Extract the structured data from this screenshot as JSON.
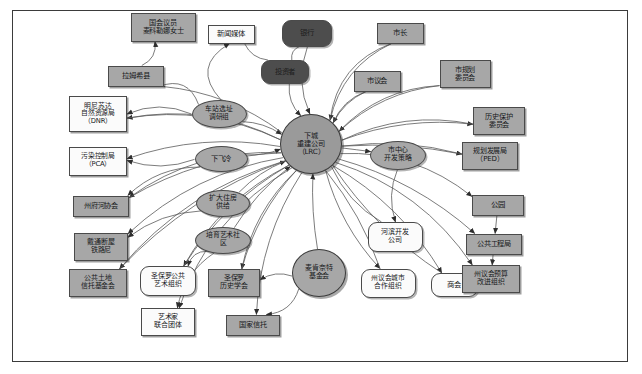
{
  "diagram": {
    "frame": {
      "border_color": "#3b3b3b",
      "background": "#ffffff"
    },
    "palette": {
      "gray_fill": "#a7a7a7",
      "white_fill": "#fbfbfb",
      "dark_fill": "#4d4d4d",
      "core_fill": "#9a9a9a",
      "edge_color": "#5a5a5a",
      "border_color": "#4a4a4a"
    },
    "legend": {
      "rect_meaning": "机构·政府部门",
      "ellipse_meaning": "项目·议题",
      "round_meaning": "企业·社会组织",
      "dark_meaning": "资本方"
    },
    "nodes": [
      {
        "id": "congress",
        "label": "国会议员\n麦科勒娜女士",
        "shape": "rect",
        "fill": "gray",
        "x": 163,
        "y": 27,
        "w": 65,
        "h": 29,
        "fs": 7.2
      },
      {
        "id": "media",
        "label": "新闻媒体",
        "shape": "rect",
        "fill": "white",
        "x": 231,
        "y": 34,
        "w": 47,
        "h": 19,
        "fs": 7.4
      },
      {
        "id": "banks",
        "label": "银行",
        "shape": "round",
        "fill": "dark",
        "x": 307,
        "y": 33,
        "w": 50,
        "h": 27,
        "fs": 7.4
      },
      {
        "id": "mayor",
        "label": "市长",
        "shape": "rect",
        "fill": "gray",
        "x": 400,
        "y": 33,
        "w": 47,
        "h": 21,
        "fs": 7.4
      },
      {
        "id": "ramsey",
        "label": "拉姆希县",
        "shape": "rect",
        "fill": "gray",
        "x": 136,
        "y": 76,
        "w": 56,
        "h": 21,
        "fs": 7.4
      },
      {
        "id": "investors",
        "label": "投资者",
        "shape": "round",
        "fill": "dark",
        "x": 285,
        "y": 72,
        "w": 48,
        "h": 24,
        "fs": 7.4
      },
      {
        "id": "council",
        "label": "市议会",
        "shape": "rect",
        "fill": "gray",
        "x": 377,
        "y": 81,
        "w": 47,
        "h": 21,
        "fs": 7.4
      },
      {
        "id": "planComm",
        "label": "市规划\n委员会",
        "shape": "rect",
        "fill": "gray",
        "x": 465,
        "y": 74,
        "w": 51,
        "h": 28,
        "fs": 7.2
      },
      {
        "id": "dnr",
        "label": "明尼苏达\n自然资源局\n（DNR）",
        "shape": "rect",
        "fill": "white",
        "x": 98,
        "y": 114,
        "w": 58,
        "h": 36,
        "fs": 6.8
      },
      {
        "id": "station",
        "label": "车站选址\n调研组",
        "shape": "ellipse",
        "fill": "gray",
        "x": 219,
        "y": 114,
        "w": 55,
        "h": 28,
        "fs": 6.8
      },
      {
        "id": "histPres",
        "label": "历史保护\n委员会",
        "shape": "rect",
        "fill": "gray",
        "x": 499,
        "y": 121,
        "w": 52,
        "h": 28,
        "fs": 7.2
      },
      {
        "id": "pca",
        "label": "污染控制局\n（PCA）",
        "shape": "rect",
        "fill": "white",
        "x": 98,
        "y": 161,
        "w": 58,
        "h": 29,
        "fs": 6.8
      },
      {
        "id": "airfall",
        "label": "下飞冷",
        "shape": "ellipse",
        "fill": "gray",
        "x": 221,
        "y": 159,
        "w": 53,
        "h": 26,
        "fs": 7.4
      },
      {
        "id": "core",
        "label": "下城\n重建公司\n（LRC）",
        "shape": "circle",
        "fill": "core",
        "x": 311,
        "y": 144,
        "w": 62,
        "h": 60,
        "fs": 7.2
      },
      {
        "id": "downtown",
        "label": "市中心\n开发策略",
        "shape": "ellipse",
        "fill": "gray",
        "x": 398,
        "y": 155,
        "w": 56,
        "h": 29,
        "fs": 6.9
      },
      {
        "id": "ped",
        "label": "规划发展局\n（PED）",
        "shape": "rect",
        "fill": "gray",
        "x": 490,
        "y": 156,
        "w": 56,
        "h": 28,
        "fs": 7.0
      },
      {
        "id": "riverAssoc",
        "label": "州府河协会",
        "shape": "rect",
        "fill": "gray",
        "x": 101,
        "y": 206,
        "w": 56,
        "h": 21,
        "fs": 7.2
      },
      {
        "id": "housing",
        "label": "扩大住房\n供给",
        "shape": "ellipse",
        "fill": "gray",
        "x": 223,
        "y": 203,
        "w": 54,
        "h": 27,
        "fs": 7.0
      },
      {
        "id": "park",
        "label": "公园",
        "shape": "rect",
        "fill": "gray",
        "x": 498,
        "y": 205,
        "w": 52,
        "h": 21,
        "fs": 7.4
      },
      {
        "id": "burlington",
        "label": "戴通断屋\n铁路尼",
        "shape": "rect",
        "fill": "gray",
        "x": 101,
        "y": 247,
        "w": 54,
        "h": 28,
        "fs": 7.0
      },
      {
        "id": "artsCommun",
        "label": "培育艺术社\n区",
        "shape": "ellipse",
        "fill": "gray",
        "x": 223,
        "y": 240,
        "w": 56,
        "h": 27,
        "fs": 6.9
      },
      {
        "id": "riverDev",
        "label": "河滨开发\n公司",
        "shape": "round",
        "fill": "white",
        "x": 395,
        "y": 237,
        "w": 55,
        "h": 30,
        "fs": 7.0
      },
      {
        "id": "publicWorks",
        "label": "公共工程局",
        "shape": "rect",
        "fill": "gray",
        "x": 494,
        "y": 244,
        "w": 56,
        "h": 21,
        "fs": 7.2
      },
      {
        "id": "trustLand",
        "label": "公共土地\n信托基金会",
        "shape": "rect",
        "fill": "gray",
        "x": 98,
        "y": 283,
        "w": 58,
        "h": 28,
        "fs": 6.9
      },
      {
        "id": "publicArt",
        "label": "圣保罗公共\n艺术组织",
        "shape": "round",
        "fill": "white",
        "x": 168,
        "y": 281,
        "w": 56,
        "h": 30,
        "fs": 6.9
      },
      {
        "id": "histSoc",
        "label": "圣保罗\n历史学会",
        "shape": "rect",
        "fill": "gray",
        "x": 234,
        "y": 283,
        "w": 52,
        "h": 28,
        "fs": 7.0
      },
      {
        "id": "mcknight",
        "label": "麦肯奈特\n基金会",
        "shape": "circle",
        "fill": "gray",
        "x": 319,
        "y": 273,
        "w": 54,
        "h": 48,
        "fs": 7.0
      },
      {
        "id": "stateCoop",
        "label": "州议会城市\n合作组织",
        "shape": "round",
        "fill": "white",
        "x": 388,
        "y": 283,
        "w": 55,
        "h": 29,
        "fs": 6.8
      },
      {
        "id": "chamber",
        "label": "商会",
        "shape": "round",
        "fill": "white",
        "x": 454,
        "y": 285,
        "w": 47,
        "h": 24,
        "fs": 7.4
      },
      {
        "id": "budget",
        "label": "州议会预算\n改进组织",
        "shape": "rect",
        "fill": "gray",
        "x": 491,
        "y": 279,
        "w": 58,
        "h": 28,
        "fs": 6.9
      },
      {
        "id": "artistGrp",
        "label": "艺术家\n联合团体",
        "shape": "rect",
        "fill": "white",
        "x": 168,
        "y": 322,
        "w": 54,
        "h": 28,
        "fs": 7.0
      },
      {
        "id": "natTrust",
        "label": "国家信托",
        "shape": "rect",
        "fill": "gray",
        "x": 253,
        "y": 325,
        "w": 54,
        "h": 21,
        "fs": 7.2
      }
    ],
    "edges": [
      {
        "from": "ramsey",
        "to": "congress",
        "arrow": true,
        "curve": 10
      },
      {
        "from": "station",
        "to": "media",
        "arrow": true,
        "curve": -35
      },
      {
        "from": "banks",
        "to": "core",
        "arrow": true,
        "curve": 14
      },
      {
        "from": "investors",
        "to": "core",
        "arrow": true,
        "curve": 8
      },
      {
        "from": "mayor",
        "to": "core",
        "arrow": true,
        "curve": 24
      },
      {
        "from": "council",
        "to": "core",
        "arrow": true,
        "curve": 8
      },
      {
        "from": "planComm",
        "to": "core",
        "arrow": true,
        "curve": 18
      },
      {
        "from": "station",
        "to": "ramsey",
        "arrow": true,
        "curve": 22
      },
      {
        "from": "station",
        "to": "dnr",
        "arrow": true,
        "curve": 14
      },
      {
        "from": "station",
        "to": "core",
        "arrow": true,
        "curve": -6
      },
      {
        "from": "core",
        "to": "histPres",
        "arrow": true,
        "curve": -16
      },
      {
        "from": "core",
        "to": "ped",
        "arrow": true,
        "curve": -8
      },
      {
        "from": "core",
        "to": "downtown",
        "arrow": true,
        "curve": 0
      },
      {
        "from": "airfall",
        "to": "core",
        "arrow": true,
        "curve": 4
      },
      {
        "from": "airfall",
        "to": "pca",
        "arrow": true,
        "curve": -12
      },
      {
        "from": "airfall",
        "to": "riverAssoc",
        "arrow": true,
        "curve": 16
      },
      {
        "from": "housing",
        "to": "core",
        "arrow": true,
        "curve": -6
      },
      {
        "from": "housing",
        "to": "burlington",
        "arrow": true,
        "curve": 12
      },
      {
        "from": "artsCommun",
        "to": "core",
        "arrow": true,
        "curve": -8
      },
      {
        "from": "artsCommun",
        "to": "publicArt",
        "arrow": true,
        "curve": 10
      },
      {
        "from": "artsCommun",
        "to": "artistGrp",
        "arrow": true,
        "curve": 14
      },
      {
        "from": "mcknight",
        "to": "core",
        "arrow": true,
        "curve": -4
      },
      {
        "from": "mcknight",
        "to": "histSoc",
        "arrow": true,
        "curve": 8
      },
      {
        "from": "mcknight",
        "to": "natTrust",
        "arrow": true,
        "curve": -14
      },
      {
        "from": "core",
        "to": "park",
        "arrow": true,
        "curve": -26
      },
      {
        "from": "park",
        "to": "publicWorks",
        "arrow": true,
        "curve": 0
      },
      {
        "from": "publicWorks",
        "to": "budget",
        "arrow": true,
        "curve": 0
      },
      {
        "from": "downtown",
        "to": "riverDev",
        "arrow": true,
        "curve": 10
      },
      {
        "from": "core",
        "to": "trustLand",
        "arrow": true,
        "curve": 30
      },
      {
        "from": "core",
        "to": "chamber",
        "arrow": true,
        "curve": -20
      },
      {
        "from": "core",
        "to": "stateCoop",
        "arrow": true,
        "curve": 14
      },
      {
        "from": "core",
        "to": "histSoc",
        "arrow": true,
        "curve": 18
      },
      {
        "from": "core",
        "to": "riverAssoc",
        "arrow": true,
        "curve": 28
      },
      {
        "from": "core",
        "to": "burlington",
        "arrow": true,
        "curve": 26
      },
      {
        "from": "core",
        "to": "pca",
        "arrow": true,
        "curve": 20
      },
      {
        "from": "core",
        "to": "dnr",
        "arrow": true,
        "curve": 24
      },
      {
        "from": "core",
        "to": "publicArt",
        "arrow": true,
        "curve": 22
      },
      {
        "from": "core",
        "to": "natTrust",
        "arrow": true,
        "curve": 20
      },
      {
        "from": "core",
        "to": "artistGrp",
        "arrow": true,
        "curve": 34
      },
      {
        "from": "core",
        "to": "mayor",
        "arrow": false,
        "curve": -30
      },
      {
        "from": "core",
        "to": "publicWorks",
        "arrow": true,
        "curve": -18
      },
      {
        "from": "core",
        "to": "budget",
        "arrow": true,
        "curve": -30
      },
      {
        "from": "core",
        "to": "planComm",
        "arrow": false,
        "curve": -22
      },
      {
        "from": "core",
        "to": "council",
        "arrow": false,
        "curve": -10
      },
      {
        "from": "core",
        "to": "ramsey",
        "arrow": false,
        "curve": 18
      },
      {
        "from": "banks",
        "to": "investors",
        "arrow": false,
        "curve": 6
      },
      {
        "from": "media",
        "to": "investors",
        "arrow": false,
        "curve": 8
      },
      {
        "from": "riverDev",
        "to": "core",
        "arrow": false,
        "curve": -12
      },
      {
        "from": "stateCoop",
        "to": "core",
        "arrow": false,
        "curve": 10
      },
      {
        "from": "chamber",
        "to": "core",
        "arrow": false,
        "curve": -16
      },
      {
        "from": "histPres",
        "to": "core",
        "arrow": false,
        "curve": 22
      },
      {
        "from": "ped",
        "to": "core",
        "arrow": false,
        "curve": 12
      },
      {
        "from": "trustLand",
        "to": "core",
        "arrow": false,
        "curve": -24
      },
      {
        "from": "histSoc",
        "to": "core",
        "arrow": false,
        "curve": -14
      },
      {
        "from": "publicArt",
        "to": "core",
        "arrow": false,
        "curve": -18
      },
      {
        "from": "dnr",
        "to": "core",
        "arrow": false,
        "curve": -26
      },
      {
        "from": "riverAssoc",
        "to": "core",
        "arrow": false,
        "curve": -20
      }
    ]
  }
}
